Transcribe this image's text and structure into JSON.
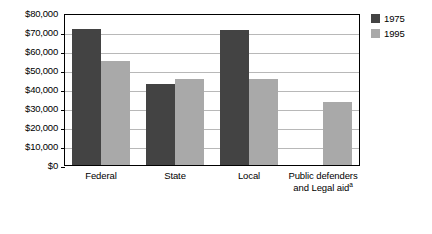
{
  "chart_data": {
    "type": "bar",
    "title": "",
    "subtitle": "",
    "xlabel": "",
    "ylabel": "",
    "categories": [
      "Federal",
      "State",
      "Local",
      "Public defenders and Legal aid"
    ],
    "category_lines": [
      [
        "Federal"
      ],
      [
        "State"
      ],
      [
        "Local"
      ],
      [
        "Public defenders",
        "and Legal aid"
      ]
    ],
    "footnote_marker": "a",
    "footnote_on_category_index": 3,
    "series": [
      {
        "name": "1975",
        "color": "#434343",
        "values": [
          71500,
          42500,
          71000,
          null
        ]
      },
      {
        "name": "1995",
        "color": "#a9a9a9",
        "values": [
          54500,
          45500,
          45500,
          33000
        ]
      }
    ],
    "ylim": [
      0,
      80000
    ],
    "ytick_values": [
      0,
      10000,
      20000,
      30000,
      40000,
      50000,
      60000,
      70000,
      80000
    ],
    "ytick_labels": [
      "$0",
      "$10,000",
      "$20,000",
      "$30,000",
      "$40,000",
      "$50,000",
      "$60,000",
      "$70,000",
      "$80,000"
    ],
    "grid": "horizontal",
    "legend_position": "top-right-outside",
    "legend_entries": [
      {
        "label": "1975",
        "color": "#434343"
      },
      {
        "label": "1995",
        "color": "#a9a9a9"
      }
    ]
  },
  "colors": {
    "series_1975": "#434343",
    "series_1995": "#a9a9a9",
    "gridline": "#b8b8b8",
    "axis": "#000000",
    "background": "#ffffff"
  }
}
